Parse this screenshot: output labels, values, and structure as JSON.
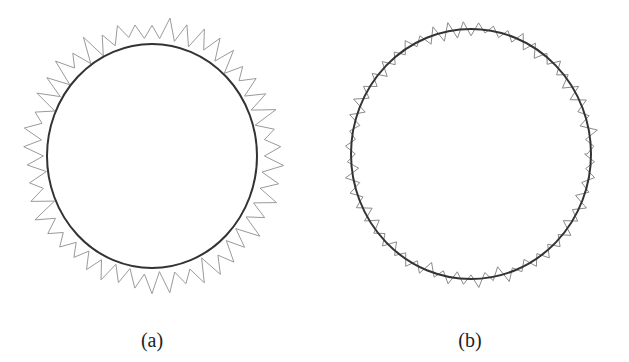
{
  "panels": [
    {
      "id": "a",
      "label": "(a)",
      "circle": {
        "cx": 152,
        "cy": 156,
        "rx": 105,
        "ry": 112,
        "color": "#333333"
      },
      "contour": {
        "amplitude": 9,
        "offset": 14,
        "teeth": 46,
        "color": "#9a9a9a",
        "seed": 3
      }
    },
    {
      "id": "b",
      "label": "(b)",
      "circle": {
        "cx": 471,
        "cy": 154,
        "rx": 120,
        "ry": 125,
        "color": "#333333"
      },
      "contour": {
        "amplitude": 6,
        "offset": 0,
        "teeth": 52,
        "color": "#8a8a8a",
        "seed": 7
      }
    }
  ]
}
